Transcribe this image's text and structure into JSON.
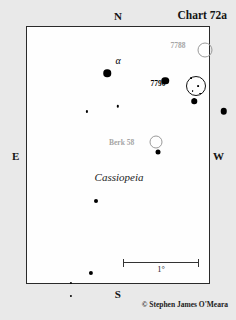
{
  "chart": {
    "title": "Chart 72a",
    "constellation": "Cassiopeia",
    "copyright": "© Stephen James O'Meara",
    "compass": {
      "north": "N",
      "south": "S",
      "east": "E",
      "west": "W"
    },
    "scale": {
      "label": "1°"
    },
    "colors": {
      "background": "#e9e9e9",
      "field": "#fefefe",
      "frame": "#2a2a2a",
      "star": "#000000",
      "faint_label": "#a5a5a5"
    }
  },
  "chart_data": {
    "type": "scatter",
    "title": "Chart 72a",
    "subtitle": "Cassiopeia",
    "xlabel": "",
    "ylabel": "",
    "grid": false,
    "legend": "none",
    "axis_note": "Sky chart: N up, S down, E left, W right. Coordinates are percentages of the plotted field.",
    "field_width_px": 184,
    "field_height_px": 258,
    "stars": [
      {
        "name": "alpha-cas",
        "x": 44,
        "y": 18,
        "size": 7.5
      },
      {
        "name": "star-7790-marker",
        "x": 76,
        "y": 21,
        "size": 7.5
      },
      {
        "name": "star-east-of-7790",
        "x": 108,
        "y": 33,
        "size": 6.5
      },
      {
        "name": "star-below-7790",
        "x": 92,
        "y": 29,
        "size": 5.5
      },
      {
        "name": "star-mid-faint-a",
        "x": 33,
        "y": 33,
        "size": 2.2
      },
      {
        "name": "star-mid-faint-b",
        "x": 50,
        "y": 31,
        "size": 2.4
      },
      {
        "name": "star-center-upper",
        "x": 72,
        "y": 49,
        "size": 5.0
      },
      {
        "name": "star-lower-left-1",
        "x": 38,
        "y": 68,
        "size": 4.0
      },
      {
        "name": "star-left-mid-1",
        "x": 35,
        "y": 96,
        "size": 4.2
      },
      {
        "name": "star-left-faint-1",
        "x": 24,
        "y": 100,
        "size": 2.2
      },
      {
        "name": "star-left-faint-2",
        "x": 24,
        "y": 105,
        "size": 2.2
      },
      {
        "name": "star-left-mid-2",
        "x": 20,
        "y": 118,
        "size": 3.8
      },
      {
        "name": "star-left-bright",
        "x": 34,
        "y": 126,
        "size": 5.8
      },
      {
        "name": "star-left-faint-3",
        "x": 45,
        "y": 124,
        "size": 2.4
      },
      {
        "name": "star-left-faint-4",
        "x": 54,
        "y": 128,
        "size": 2.4
      },
      {
        "name": "beta-cas",
        "x": 31,
        "y": 183,
        "size": 14.5
      }
    ],
    "cluster_stars": [
      {
        "name": "ngc7790-member-1",
        "x": 90,
        "y": 20,
        "size": 1.8
      },
      {
        "name": "ngc7790-member-2",
        "x": 94,
        "y": 23,
        "size": 1.8
      },
      {
        "name": "ngc7790-member-3",
        "x": 91,
        "y": 25,
        "size": 1.8
      },
      {
        "name": "ngc7790-member-4",
        "x": 95,
        "y": 26,
        "size": 1.8
      },
      {
        "name": "ngc7790-member-5",
        "x": 92,
        "y": 28,
        "size": 1.6
      }
    ],
    "clusters": [
      {
        "name": "NGC 7788",
        "label": "7788",
        "x": 98,
        "y": 9,
        "diameter": 15,
        "style": "open",
        "label_x": 83,
        "label_y": 7
      },
      {
        "name": "NGC 7790",
        "label": "7790",
        "x": 93,
        "y": 23,
        "diameter": 20,
        "style": "bold",
        "label_x": 72,
        "label_y": 22
      },
      {
        "name": "Berkeley 58",
        "label": "Berk 58",
        "x": 71,
        "y": 45,
        "diameter": 13,
        "style": "open",
        "label_x": 52,
        "label_y": 45
      }
    ],
    "greek_labels": [
      {
        "name": "alpha",
        "text": "α",
        "x": 50,
        "y": 13
      },
      {
        "name": "beta",
        "text": "β",
        "x": 42,
        "y": 184
      }
    ]
  }
}
